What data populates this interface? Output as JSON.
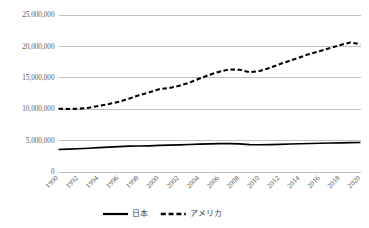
{
  "chart_data": {
    "type": "line",
    "title": "",
    "subtitle": "",
    "xlabel": "",
    "ylabel": "",
    "grid": true,
    "legend_position": "bottom",
    "xlim": [
      1990,
      2020
    ],
    "ylim": [
      0,
      25000000
    ],
    "x": [
      1990,
      1991,
      1992,
      1993,
      1994,
      1995,
      1996,
      1997,
      1998,
      1999,
      2000,
      2001,
      2002,
      2003,
      2004,
      2005,
      2006,
      2007,
      2008,
      2009,
      2010,
      2011,
      2012,
      2013,
      2014,
      2015,
      2016,
      2017,
      2018,
      2019,
      2020
    ],
    "x_tick_labels": [
      "1990",
      "1992",
      "1994",
      "1996",
      "1998",
      "2000",
      "2002",
      "2004",
      "2006",
      "2008",
      "2010",
      "2012",
      "2014",
      "2016",
      "2018",
      "2020"
    ],
    "y_tick_labels": [
      "0",
      "5,000,000",
      "10,000,000",
      "15,000,000",
      "20,000,000",
      "25,000,000"
    ],
    "y_tick_values": [
      0,
      5000000,
      10000000,
      15000000,
      20000000,
      25000000
    ],
    "series": [
      {
        "name": "日本",
        "style": "solid",
        "color": "#000000",
        "values": [
          3500000,
          3560000,
          3620000,
          3700000,
          3790000,
          3880000,
          3960000,
          4030000,
          4060000,
          4090000,
          4150000,
          4200000,
          4250000,
          4300000,
          4360000,
          4400000,
          4430000,
          4450000,
          4400000,
          4280000,
          4260000,
          4280000,
          4330000,
          4380000,
          4420000,
          4460000,
          4500000,
          4540000,
          4570000,
          4600000,
          4620000
        ]
      },
      {
        "name": "アメリカ",
        "style": "dashed",
        "color": "#000000",
        "values": [
          10000000,
          9950000,
          10000000,
          10150000,
          10450000,
          10750000,
          11100000,
          11600000,
          12150000,
          12600000,
          13100000,
          13300000,
          13650000,
          14150000,
          14800000,
          15400000,
          15900000,
          16250000,
          16200000,
          15800000,
          16000000,
          16500000,
          17100000,
          17650000,
          18200000,
          18750000,
          19200000,
          19650000,
          20150000,
          20550000,
          20250000
        ]
      }
    ]
  },
  "legend": {
    "entries": [
      {
        "label": "日本",
        "style": "solid"
      },
      {
        "label": "アメリカ",
        "style": "dashed"
      }
    ]
  }
}
